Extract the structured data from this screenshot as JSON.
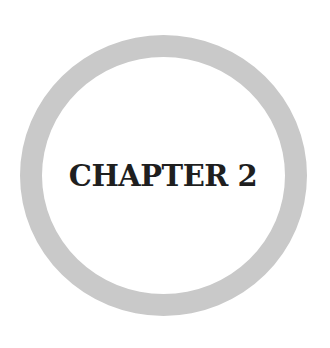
{
  "chapter": {
    "title": "CHAPTER 2"
  },
  "colors": {
    "ring": "#c9c9c9",
    "text": "#1f1f1f",
    "background": "#ffffff"
  }
}
